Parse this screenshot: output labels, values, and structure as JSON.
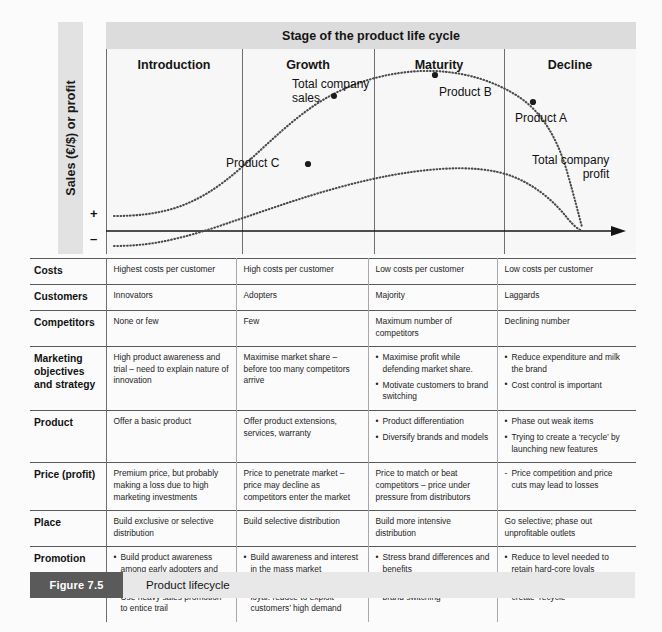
{
  "chart": {
    "banner_title": "Stage of the product life cycle",
    "y_axis_label": "Sales (€/$) or profit",
    "axis_plus": "+",
    "axis_minus": "–",
    "stages": [
      "Introduction",
      "Growth",
      "Maturity",
      "Decline"
    ],
    "annotations": {
      "total_sales": "Total company\nsales",
      "total_profit": "Total company\nprofit",
      "product_c": "Product C",
      "product_b": "Product B",
      "product_a": "Product A"
    }
  },
  "chart_data": {
    "type": "line",
    "title": "Stage of the product life cycle",
    "xlabel": "",
    "ylabel": "Sales (€/$) or profit",
    "grid": false,
    "legend": "inline-annotations",
    "x_categories": [
      "Introduction",
      "Growth",
      "Maturity",
      "Decline"
    ],
    "y_ticks": [
      "+",
      "–"
    ],
    "ylim": [
      -1,
      10
    ],
    "series": [
      {
        "name": "Total company sales",
        "x": [
          0,
          0.5,
          1.0,
          1.5,
          2.0,
          2.5,
          3.0,
          3.5,
          4.0,
          4.5,
          5.0,
          5.5,
          6.0,
          6.5,
          7.0,
          7.5,
          8.0
        ],
        "y": [
          0.9,
          0.9,
          1.0,
          1.2,
          1.6,
          2.3,
          3.3,
          4.6,
          6.0,
          7.3,
          8.4,
          9.1,
          9.4,
          9.3,
          8.7,
          7.5,
          5.6
        ]
      },
      {
        "name": "Total company profit",
        "x": [
          0,
          0.5,
          1.0,
          1.5,
          2.0,
          2.5,
          3.0,
          3.5,
          4.0,
          4.5,
          5.0,
          5.5,
          6.0,
          6.5,
          7.0,
          7.5,
          8.0
        ],
        "y": [
          -0.7,
          -0.7,
          -0.5,
          -0.1,
          0.5,
          1.2,
          1.9,
          2.6,
          3.2,
          3.7,
          4.0,
          4.2,
          4.2,
          4.0,
          3.4,
          2.2,
          0.0
        ]
      }
    ],
    "markers": [
      {
        "label": "Product C",
        "stage": "Growth",
        "series": "Total company sales",
        "x": 2.9,
        "y": 3.1
      },
      {
        "label": "Product B",
        "stage": "Maturity",
        "series": "Total company sales",
        "x": 5.3,
        "y": 9.0
      },
      {
        "label": "Product A",
        "stage": "Decline",
        "series": "Total company sales",
        "x": 7.0,
        "y": 7.8
      }
    ]
  },
  "table": {
    "rows": [
      {
        "label": "Costs",
        "cells": [
          {
            "type": "plain",
            "text": "Highest costs per customer"
          },
          {
            "type": "plain",
            "text": "High costs per customer"
          },
          {
            "type": "plain",
            "text": "Low costs per customer"
          },
          {
            "type": "plain",
            "text": "Low costs per customer"
          }
        ]
      },
      {
        "label": "Customers",
        "cells": [
          {
            "type": "plain",
            "text": "Innovators"
          },
          {
            "type": "plain",
            "text": "Adopters"
          },
          {
            "type": "plain",
            "text": "Majority"
          },
          {
            "type": "plain",
            "text": "Laggards"
          }
        ]
      },
      {
        "label": "Competitors",
        "cells": [
          {
            "type": "plain",
            "text": "None or few"
          },
          {
            "type": "plain",
            "text": "Few"
          },
          {
            "type": "plain",
            "text": "Maximum number of competitors"
          },
          {
            "type": "plain",
            "text": "Declining number"
          }
        ]
      },
      {
        "label": "Marketing objectives and strategy",
        "cells": [
          {
            "type": "plain",
            "text": "High product awareness and trial – need to explain nature of innovation"
          },
          {
            "type": "plain",
            "text": "Maximise market share – before too many competitors arrive"
          },
          {
            "type": "bullets",
            "items": [
              "Maximise profit while defending market share.",
              "Motivate customers to brand switching"
            ]
          },
          {
            "type": "bullets",
            "items": [
              "Reduce expenditure and milk the brand",
              "Cost control is important"
            ]
          }
        ]
      },
      {
        "label": "Product",
        "cells": [
          {
            "type": "plain",
            "text": "Offer a basic product"
          },
          {
            "type": "plain",
            "text": "Offer product extensions, services, warranty"
          },
          {
            "type": "bullets",
            "items": [
              "Product differentiation",
              "Diversify brands and models"
            ]
          },
          {
            "type": "bullets",
            "items": [
              "Phase out weak items",
              "Trying to create a ‘recycle’ by launching new features"
            ]
          }
        ]
      },
      {
        "label": "Price (profit)",
        "cells": [
          {
            "type": "plain",
            "text": "Premium price, but probably making a loss due to high marketing investments"
          },
          {
            "type": "plain",
            "text": "Price to penetrate market – price may decline as competitors enter the market"
          },
          {
            "type": "plain",
            "text": "Price to match or beat competitors – price under pressure from distributors"
          },
          {
            "type": "dashes",
            "items": [
              "Price competition and price cuts may lead to losses"
            ]
          }
        ]
      },
      {
        "label": "Place",
        "cells": [
          {
            "type": "plain",
            "text": "Build exclusive or selective distribution"
          },
          {
            "type": "plain",
            "text": "Build selective distribution"
          },
          {
            "type": "plain",
            "text": "Build more intensive distribution"
          },
          {
            "type": "plain",
            "text": "Go selective; phase out unprofitable outlets"
          }
        ]
      },
      {
        "label": "Promotion",
        "cells": [
          {
            "type": "bullets",
            "items": [
              "Build product awareness among early adopters and distributors",
              "Use heavy sales promotion to entice trail"
            ]
          },
          {
            "type": "bullets",
            "items": [
              "Build awareness and interest in the mass market",
              "Alternative if customers are loyal: reduce to exploit customers’ high demand"
            ]
          },
          {
            "type": "bullets",
            "items": [
              "Stress brand differences and benefits",
              "Increase to encourage brand switching"
            ]
          },
          {
            "type": "bullets",
            "items": [
              "Reduce to level needed to retain hard-core loyals",
              "Alternative: increase in order to create ‘recycle’"
            ]
          }
        ]
      }
    ]
  },
  "caption": {
    "tag": "Figure 7.5",
    "title": "Product lifecycle"
  },
  "colors": {
    "banner_grey": "#dcdcdc",
    "strip_grey": "#e2e2e2",
    "caption_bar": "#e8e8e8",
    "caption_tag": "#5a5a5a",
    "rule": "#5a5a5a",
    "plot_bg": "#f7f7f7"
  }
}
